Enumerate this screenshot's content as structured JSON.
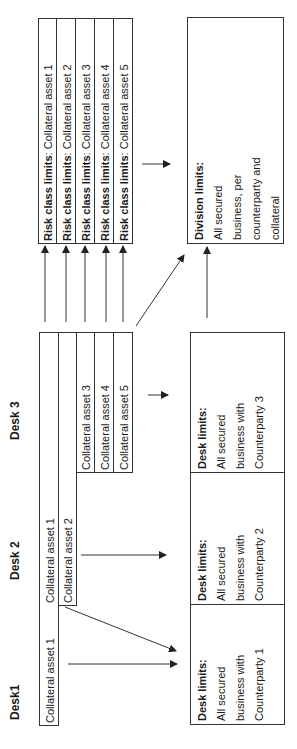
{
  "desks": [
    {
      "label": "Desk1"
    },
    {
      "label": "Desk 2"
    },
    {
      "label": "Desk 3"
    }
  ],
  "assets": {
    "desk1": [
      "Collateral asset 1"
    ],
    "desk2": [
      "Collateral asset 1",
      "Collateral asset 2"
    ],
    "desk3": [
      "Collateral asset 3",
      "Collateral asset 4",
      "Collateral asset 5"
    ]
  },
  "risk_class": {
    "prefix": "Risk class limits",
    "items": [
      "Collateral asset 1",
      "Collateral asset 2",
      "Collateral asset 3",
      "Collateral asset 4",
      "Collateral asset 5"
    ]
  },
  "desk_limits": [
    {
      "title": "Desk limits:",
      "lines": [
        "All secured",
        "business with",
        "Counterparty 1"
      ]
    },
    {
      "title": "Desk limits:",
      "lines": [
        "All secured",
        "business with",
        "Counterparty 2"
      ]
    },
    {
      "title": "Desk limits:",
      "lines": [
        "All secured",
        "business with",
        "Counterparty 3"
      ]
    }
  ],
  "division_limits": {
    "title": "Division limits:",
    "lines": [
      "All secured",
      "business, per",
      "counterparty and",
      "collateral"
    ]
  },
  "colors": {
    "line": "#333333",
    "text": "#1a1a1a",
    "background": "#ffffff"
  }
}
